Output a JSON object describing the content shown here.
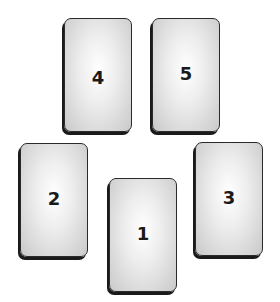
{
  "cards": [
    {
      "label": "4",
      "x": 64,
      "y": 18,
      "num_top": 48
    },
    {
      "label": "5",
      "x": 152,
      "y": 18,
      "num_top": 45
    },
    {
      "label": "2",
      "x": 20,
      "y": 143,
      "num_top": 45
    },
    {
      "label": "1",
      "x": 109,
      "y": 178,
      "num_top": 45
    },
    {
      "label": "3",
      "x": 195,
      "y": 142,
      "num_top": 45
    }
  ]
}
